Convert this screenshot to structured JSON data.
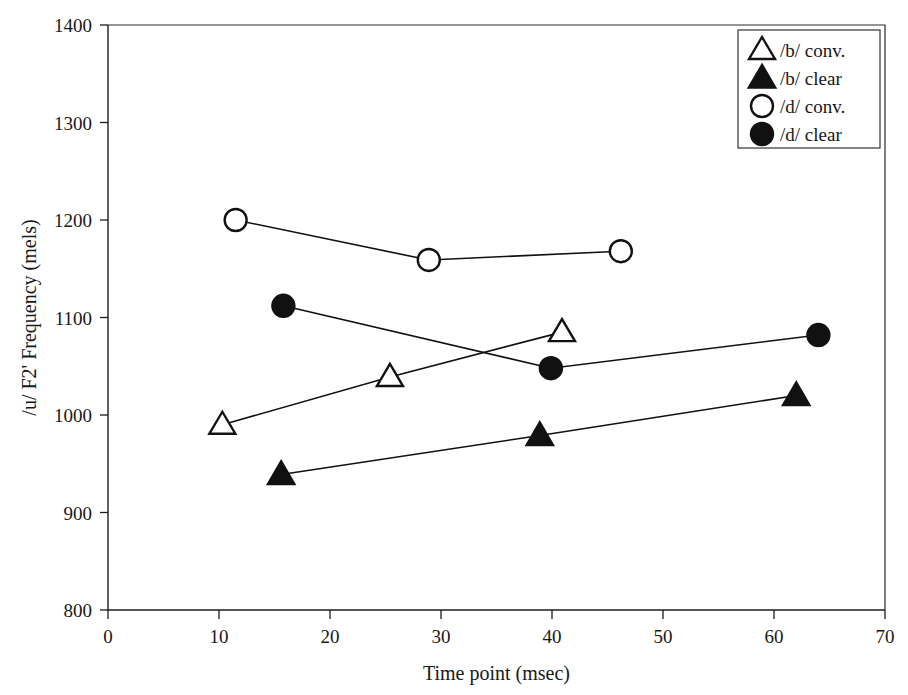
{
  "chart_data": {
    "type": "line",
    "title": "",
    "xlabel": "Time point (msec)",
    "ylabel": "/u/ F2' Frequency (mels)",
    "xlim": [
      0,
      70
    ],
    "ylim": [
      800,
      1400
    ],
    "xticks": [
      0,
      10,
      20,
      30,
      40,
      50,
      60,
      70
    ],
    "yticks": [
      800,
      900,
      1000,
      1100,
      1200,
      1300,
      1400
    ],
    "xtick_labels": [
      "0",
      "10",
      "20",
      "30",
      "40",
      "50",
      "60",
      "70"
    ],
    "ytick_labels": [
      "800",
      "900",
      "1000",
      "1100",
      "1200",
      "1300",
      "1400"
    ],
    "grid": false,
    "legend_position": "top-right",
    "series": [
      {
        "name": "/b/ conv.",
        "marker": "open-triangle",
        "x": [
          10.3,
          25.4,
          40.9
        ],
        "y": [
          990,
          1039,
          1085
        ]
      },
      {
        "name": "/b/ clear",
        "marker": "filled-triangle",
        "x": [
          15.6,
          38.9,
          62.0
        ],
        "y": [
          939,
          979,
          1020
        ]
      },
      {
        "name": "/d/ conv.",
        "marker": "open-circle",
        "x": [
          11.5,
          28.9,
          46.2
        ],
        "y": [
          1200,
          1159,
          1168
        ]
      },
      {
        "name": "/d/ clear",
        "marker": "filled-circle",
        "x": [
          15.8,
          39.9,
          64.0
        ],
        "y": [
          1112,
          1048,
          1082
        ]
      }
    ]
  },
  "legend": {
    "entries": [
      {
        "label": "/b/ conv.",
        "marker": "open-triangle"
      },
      {
        "label": "/b/ clear",
        "marker": "filled-triangle"
      },
      {
        "label": "/d/ conv.",
        "marker": "open-circle"
      },
      {
        "label": "/d/ clear",
        "marker": "filled-circle"
      }
    ]
  },
  "colors": {
    "ink": "#111111",
    "axis": "#1d1d1d",
    "background": "#ffffff"
  }
}
